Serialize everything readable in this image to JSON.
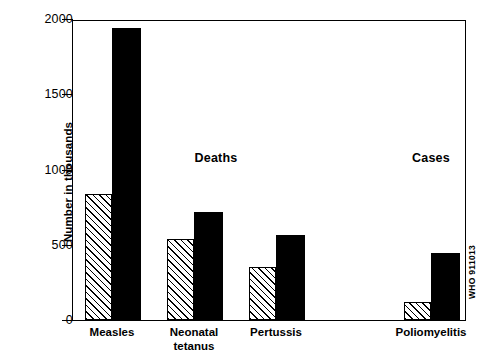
{
  "chart_data": {
    "type": "bar",
    "title": "",
    "subtitle": "",
    "xlabel": "",
    "ylabel": "Number in thousands",
    "ylim": [
      0,
      2000
    ],
    "yticks": [
      0,
      500,
      1000,
      1500,
      2000
    ],
    "ytick_labels": [
      "0",
      "500",
      "1000",
      "1500",
      "2000"
    ],
    "grid": false,
    "legend_position": "top-right",
    "categories": [
      "Measles",
      "Neonatal tetanus",
      "Pertussis",
      "Poliomyelitis"
    ],
    "category_labels": [
      "Measles",
      "Neonatal\ntetanus",
      "Pertussis",
      "Poliomyelitis"
    ],
    "series": [
      {
        "name": "Occurring",
        "fill": "diagonal-hatch",
        "values": [
          840,
          540,
          355,
          120
        ]
      },
      {
        "name": "Prevented",
        "fill": "solid-black",
        "values": [
          1940,
          720,
          565,
          445
        ]
      }
    ],
    "annotations": [
      {
        "text": "Deaths",
        "x_px": 215,
        "y_px": 157
      },
      {
        "text": "Cases",
        "x_px": 430,
        "y_px": 157
      }
    ],
    "source_stamp": "WHO 911013",
    "colors": {
      "axis": "#000000",
      "prevented": "#000000",
      "occurring_outline": "#000000",
      "background": "#ffffff"
    }
  },
  "layout": {
    "bars_px": [
      {
        "category": "Measles",
        "occurring": {
          "left": 84,
          "width": 27
        },
        "prevented": {
          "left": 111,
          "width": 29
        }
      },
      {
        "category": "Neonatal tetanus",
        "occurring": {
          "left": 166,
          "width": 27
        },
        "prevented": {
          "left": 193,
          "width": 29
        }
      },
      {
        "category": "Pertussis",
        "occurring": {
          "left": 248,
          "width": 27
        },
        "prevented": {
          "left": 275,
          "width": 29
        }
      },
      {
        "category": "Poliomyelitis",
        "occurring": {
          "left": 403,
          "width": 27
        },
        "prevented": {
          "left": 430,
          "width": 29
        }
      }
    ],
    "label_x_px": [
      112,
      194,
      276,
      431
    ]
  }
}
